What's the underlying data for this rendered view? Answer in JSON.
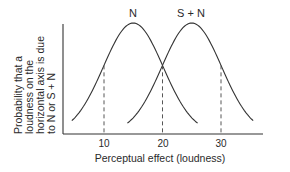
{
  "chart_data": {
    "type": "line",
    "title": "",
    "xlabel": "Perceptual effect (loudness)",
    "ylabel": [
      "Probability that a",
      "loudness on the",
      "horizontal axis is due",
      "to N or S + N"
    ],
    "x_ticks": [
      10,
      20,
      30
    ],
    "xlim": [
      3,
      40
    ],
    "grid": false,
    "legend": "curve labels above peaks",
    "series": [
      {
        "name": "N",
        "distribution": "normal",
        "mean": 15,
        "peak_relative": 1.0,
        "x_range": [
          4.5,
          26
        ]
      },
      {
        "name": "S + N",
        "distribution": "normal",
        "mean": 25,
        "peak_relative": 1.0,
        "x_range": [
          14,
          35.5
        ]
      }
    ],
    "annotations": [
      {
        "type": "dashed-vertical",
        "x": 10
      },
      {
        "type": "dashed-vertical",
        "x": 20,
        "note": "intersection of N and S + N curves"
      },
      {
        "type": "dashed-vertical",
        "x": 30
      }
    ]
  },
  "labels": {
    "series_n": "N",
    "series_sn": "S + N",
    "tick_10": "10",
    "tick_20": "20",
    "tick_30": "30",
    "xlabel": "Perceptual effect (loudness)",
    "ylabel_1": "Probability that a",
    "ylabel_2": "loudness on the",
    "ylabel_3": "horizontal axis is due",
    "ylabel_4": "to N or S + N"
  }
}
